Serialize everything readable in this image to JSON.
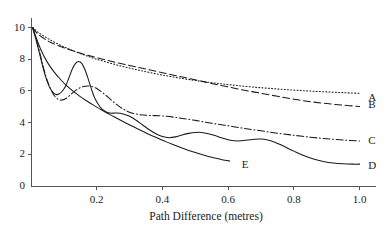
{
  "chart_data": {
    "type": "line",
    "title": "",
    "xlabel": "Path Difference (metres)",
    "ylabel": "",
    "xlim": [
      0.0,
      1.05
    ],
    "ylim": [
      0,
      10.6
    ],
    "grid": false,
    "legend_position": "right-inline-end-labels",
    "xticks": [
      "0.2",
      "0.4",
      "0.6",
      "0.8",
      "1.0"
    ],
    "xtick_values": [
      0.2,
      0.4,
      0.6,
      0.8,
      1.0
    ],
    "yticks": [
      "0",
      "2",
      "4",
      "6",
      "8",
      "10"
    ],
    "ytick_values": [
      0,
      2,
      4,
      6,
      8,
      10
    ],
    "series": [
      {
        "name": "A",
        "style": "dotted",
        "label": "A",
        "label_x": 1.02,
        "label_y": 5.55,
        "x": [
          0.005,
          0.02,
          0.04,
          0.06,
          0.09,
          0.12,
          0.16,
          0.2,
          0.25,
          0.3,
          0.35,
          0.4,
          0.45,
          0.5,
          0.55,
          0.6,
          0.65,
          0.7,
          0.75,
          0.8,
          0.85,
          0.9,
          0.95,
          1.0
        ],
        "y": [
          10.0,
          9.72,
          9.45,
          9.2,
          8.88,
          8.6,
          8.28,
          8.0,
          7.7,
          7.44,
          7.21,
          7.0,
          6.82,
          6.66,
          6.52,
          6.4,
          6.29,
          6.2,
          6.12,
          6.05,
          5.99,
          5.94,
          5.89,
          5.85
        ]
      },
      {
        "name": "B",
        "style": "dashed",
        "label": "B",
        "label_x": 1.02,
        "label_y": 5.1,
        "x": [
          0.005,
          0.02,
          0.04,
          0.06,
          0.09,
          0.12,
          0.16,
          0.2,
          0.25,
          0.3,
          0.35,
          0.4,
          0.45,
          0.5,
          0.55,
          0.6,
          0.65,
          0.7,
          0.75,
          0.8,
          0.85,
          0.9,
          0.95,
          1.0
        ],
        "y": [
          10.0,
          9.6,
          9.3,
          9.06,
          8.8,
          8.58,
          8.32,
          8.1,
          7.84,
          7.6,
          7.38,
          7.15,
          6.92,
          6.7,
          6.47,
          6.25,
          6.04,
          5.85,
          5.66,
          5.48,
          5.32,
          5.2,
          5.1,
          5.02
        ]
      },
      {
        "name": "C",
        "style": "dash-dot",
        "label": "C",
        "label_x": 1.02,
        "label_y": 2.82,
        "x": [
          0.005,
          0.015,
          0.025,
          0.035,
          0.045,
          0.055,
          0.065,
          0.075,
          0.085,
          0.095,
          0.105,
          0.115,
          0.125,
          0.135,
          0.15,
          0.165,
          0.18,
          0.2,
          0.22,
          0.24,
          0.26,
          0.28,
          0.3,
          0.33,
          0.36,
          0.4,
          0.45,
          0.5,
          0.55,
          0.6,
          0.65,
          0.7,
          0.75,
          0.8,
          0.85,
          0.9,
          0.95,
          1.0
        ],
        "y": [
          10.0,
          9.3,
          8.55,
          7.7,
          6.95,
          6.35,
          5.9,
          5.6,
          5.45,
          5.42,
          5.5,
          5.66,
          5.85,
          6.02,
          6.2,
          6.3,
          6.3,
          6.15,
          5.85,
          5.5,
          5.15,
          4.86,
          4.66,
          4.5,
          4.45,
          4.42,
          4.3,
          4.14,
          3.96,
          3.8,
          3.63,
          3.48,
          3.33,
          3.2,
          3.08,
          2.98,
          2.9,
          2.84
        ]
      },
      {
        "name": "D",
        "style": "solid",
        "label": "D",
        "label_x": 1.02,
        "label_y": 1.28,
        "x": [
          0.005,
          0.015,
          0.025,
          0.035,
          0.045,
          0.055,
          0.065,
          0.075,
          0.085,
          0.095,
          0.105,
          0.115,
          0.125,
          0.135,
          0.145,
          0.155,
          0.165,
          0.175,
          0.185,
          0.195,
          0.21,
          0.225,
          0.24,
          0.26,
          0.28,
          0.3,
          0.32,
          0.34,
          0.36,
          0.38,
          0.4,
          0.42,
          0.44,
          0.46,
          0.48,
          0.5,
          0.52,
          0.54,
          0.56,
          0.58,
          0.6,
          0.62,
          0.64,
          0.66,
          0.68,
          0.7,
          0.72,
          0.74,
          0.76,
          0.78,
          0.8,
          0.83,
          0.86,
          0.89,
          0.92,
          0.95,
          0.98,
          1.0
        ],
        "y": [
          10.0,
          9.25,
          8.45,
          7.6,
          6.85,
          6.3,
          5.95,
          5.78,
          5.8,
          5.98,
          6.3,
          6.8,
          7.35,
          7.72,
          7.85,
          7.72,
          7.3,
          6.7,
          6.05,
          5.5,
          5.0,
          4.72,
          4.6,
          4.6,
          4.55,
          4.4,
          4.15,
          3.85,
          3.55,
          3.3,
          3.12,
          3.05,
          3.1,
          3.22,
          3.32,
          3.38,
          3.38,
          3.3,
          3.18,
          3.04,
          2.92,
          2.85,
          2.85,
          2.9,
          2.95,
          2.96,
          2.9,
          2.78,
          2.6,
          2.4,
          2.2,
          1.92,
          1.7,
          1.55,
          1.45,
          1.4,
          1.38,
          1.38
        ]
      },
      {
        "name": "E",
        "style": "solid",
        "label": "E",
        "label_x": 0.635,
        "label_y": 1.32,
        "x": [
          0.005,
          0.015,
          0.03,
          0.05,
          0.07,
          0.09,
          0.11,
          0.13,
          0.15,
          0.17,
          0.19,
          0.21,
          0.23,
          0.25,
          0.27,
          0.29,
          0.31,
          0.33,
          0.35,
          0.37,
          0.39,
          0.41,
          0.43,
          0.45,
          0.47,
          0.49,
          0.51,
          0.53,
          0.55,
          0.57,
          0.59,
          0.605
        ],
        "y": [
          10.0,
          9.4,
          8.6,
          7.8,
          7.2,
          6.72,
          6.3,
          5.95,
          5.64,
          5.36,
          5.1,
          4.86,
          4.62,
          4.4,
          4.18,
          3.96,
          3.75,
          3.55,
          3.35,
          3.16,
          2.98,
          2.8,
          2.63,
          2.47,
          2.32,
          2.18,
          2.05,
          1.93,
          1.82,
          1.72,
          1.62,
          1.58
        ]
      }
    ]
  },
  "axis": {
    "x_title": "Path Difference (metres)"
  },
  "colors": {
    "axis": "#555555",
    "curve": "#1a1a1a",
    "text": "#1a1a1a"
  }
}
